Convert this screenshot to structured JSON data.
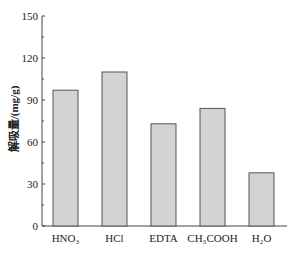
{
  "chart_data": {
    "type": "bar",
    "title": "",
    "xlabel": "",
    "ylabel": "解吸量/(mg/g)",
    "categories": [
      "HNO3",
      "HCl",
      "EDTA",
      "CH3COOH",
      "H2O"
    ],
    "category_labels_display": [
      "HNO₃",
      "HCl",
      "EDTA",
      "CH₃COOH",
      "H₂O"
    ],
    "values": [
      97,
      110,
      73,
      84,
      38
    ],
    "ylim": [
      0,
      150
    ],
    "yticks": [
      0,
      30,
      60,
      90,
      120,
      150
    ],
    "grid": false,
    "legend": null,
    "bar_color": "#d3d3d3",
    "bar_edge_color": "#555555"
  }
}
